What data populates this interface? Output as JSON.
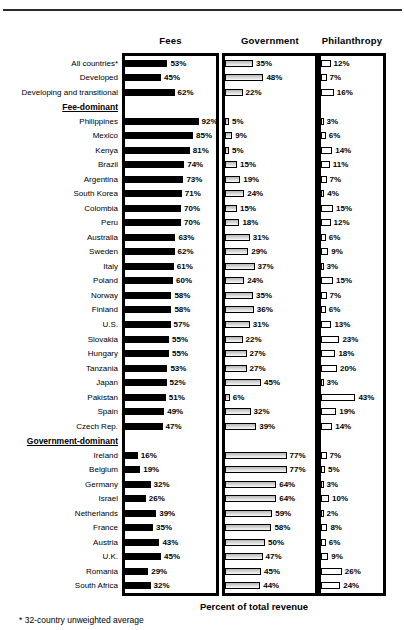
{
  "chart_data": {
    "type": "bar",
    "orientation": "horizontal",
    "unit": "%",
    "xlim": [
      0,
      100
    ],
    "panel_titles": [
      "Fees",
      "Government",
      "Philanthropy"
    ],
    "xlabel": "Percent of total revenue",
    "footnote": "* 32-country unweighted average",
    "bar_styles": {
      "fees_fill": "#000000",
      "government_fill": "#d9d9d9",
      "philanthropy_fill": "#ffffff",
      "outline": "#000000"
    },
    "rows": [
      {
        "label": "All countries*",
        "values": [
          53,
          35,
          12
        ],
        "labels": [
          "53%",
          "35%",
          "12%"
        ]
      },
      {
        "label": "Developed",
        "values": [
          45,
          48,
          7
        ],
        "labels": [
          "45%",
          "48%",
          "7%"
        ]
      },
      {
        "label": "Developing and transitional",
        "values": [
          62,
          22,
          16
        ],
        "labels": [
          "62%",
          "22%",
          "16%"
        ]
      },
      {
        "heading": true,
        "label": "Fee-dominant"
      },
      {
        "label": "Philippines",
        "values": [
          92,
          5,
          3
        ],
        "labels": [
          "92%",
          "5%",
          "3%"
        ]
      },
      {
        "label": "Mexico",
        "values": [
          85,
          9,
          6
        ],
        "labels": [
          "85%",
          "9%",
          "6%"
        ]
      },
      {
        "label": "Kenya",
        "values": [
          81,
          5,
          14
        ],
        "labels": [
          "81%",
          "5%",
          "14%"
        ]
      },
      {
        "label": "Brazil",
        "values": [
          74,
          15,
          11
        ],
        "labels": [
          "74%",
          "15%",
          "11%"
        ]
      },
      {
        "label": "Argentina",
        "values": [
          73,
          19,
          7
        ],
        "labels": [
          "73%",
          "19%",
          "7%"
        ]
      },
      {
        "label": "South Korea",
        "values": [
          71,
          24,
          4
        ],
        "labels": [
          "71%",
          "24%",
          "4%"
        ]
      },
      {
        "label": "Colombia",
        "values": [
          70,
          15,
          15
        ],
        "labels": [
          "70%",
          "15%",
          "15%"
        ]
      },
      {
        "label": "Peru",
        "values": [
          70,
          18,
          12
        ],
        "labels": [
          "70%",
          "18%",
          "12%"
        ]
      },
      {
        "label": "Australia",
        "values": [
          63,
          31,
          6
        ],
        "labels": [
          "63%",
          "31%",
          "6%"
        ]
      },
      {
        "label": "Sweden",
        "values": [
          62,
          29,
          9
        ],
        "labels": [
          "62%",
          "29%",
          "9%"
        ]
      },
      {
        "label": "Italy",
        "values": [
          61,
          37,
          3
        ],
        "labels": [
          "61%",
          "37%",
          "3%"
        ]
      },
      {
        "label": "Poland",
        "values": [
          60,
          24,
          15
        ],
        "labels": [
          "60%",
          "24%",
          "15%"
        ]
      },
      {
        "label": "Norway",
        "values": [
          58,
          35,
          7
        ],
        "labels": [
          "58%",
          "35%",
          "7%"
        ]
      },
      {
        "label": "Finland",
        "values": [
          58,
          36,
          6
        ],
        "labels": [
          "58%",
          "36%",
          "6%"
        ]
      },
      {
        "label": "U.S.",
        "values": [
          57,
          31,
          13
        ],
        "labels": [
          "57%",
          "31%",
          "13%"
        ]
      },
      {
        "label": "Slovakia",
        "values": [
          55,
          22,
          23
        ],
        "labels": [
          "55%",
          "22%",
          "23%"
        ]
      },
      {
        "label": "Hungary",
        "values": [
          55,
          27,
          18
        ],
        "labels": [
          "55%",
          "27%",
          "18%"
        ]
      },
      {
        "label": "Tanzania",
        "values": [
          53,
          27,
          20
        ],
        "labels": [
          "53%",
          "27%",
          "20%"
        ]
      },
      {
        "label": "Japan",
        "values": [
          52,
          45,
          3
        ],
        "labels": [
          "52%",
          "45%",
          "3%"
        ]
      },
      {
        "label": "Pakistan",
        "values": [
          51,
          6,
          43
        ],
        "labels": [
          "51%",
          "6%",
          "43%"
        ]
      },
      {
        "label": "Spain",
        "values": [
          49,
          32,
          19
        ],
        "labels": [
          "49%",
          "32%",
          "19%"
        ]
      },
      {
        "label": "Czech Rep.",
        "values": [
          47,
          39,
          14
        ],
        "labels": [
          "47%",
          "39%",
          "14%"
        ]
      },
      {
        "heading": true,
        "label": "Government-dominant"
      },
      {
        "label": "Ireland",
        "values": [
          16,
          77,
          7
        ],
        "labels": [
          "16%",
          "77%",
          "7%"
        ]
      },
      {
        "label": "Belgium",
        "values": [
          19,
          77,
          5
        ],
        "labels": [
          "19%",
          "77%",
          "5%"
        ]
      },
      {
        "label": "Germany",
        "values": [
          32,
          64,
          3
        ],
        "labels": [
          "32%",
          "64%",
          "3%"
        ]
      },
      {
        "label": "Israel",
        "values": [
          26,
          64,
          10
        ],
        "labels": [
          "26%",
          "64%",
          "10%"
        ]
      },
      {
        "label": "Netherlands",
        "values": [
          39,
          59,
          2
        ],
        "labels": [
          "39%",
          "59%",
          "2%"
        ]
      },
      {
        "label": "France",
        "values": [
          35,
          58,
          8
        ],
        "labels": [
          "35%",
          "58%",
          "8%"
        ]
      },
      {
        "label": "Austria",
        "values": [
          43,
          50,
          6
        ],
        "labels": [
          "43%",
          "50%",
          "6%"
        ]
      },
      {
        "label": "U.K.",
        "values": [
          45,
          47,
          9
        ],
        "labels": [
          "45%",
          "47%",
          "9%"
        ]
      },
      {
        "label": "Romania",
        "values": [
          29,
          45,
          26
        ],
        "labels": [
          "29%",
          "45%",
          "26%"
        ]
      },
      {
        "label": "South Africa",
        "values": [
          32,
          44,
          24
        ],
        "labels": [
          "32%",
          "44%",
          "24%"
        ]
      }
    ]
  }
}
